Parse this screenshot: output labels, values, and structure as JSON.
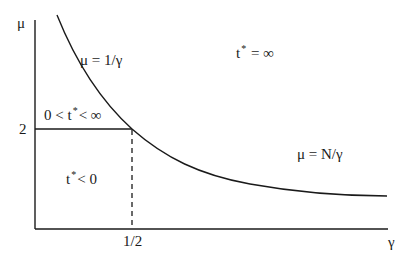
{
  "diagram": {
    "axes": {
      "y_label": "μ",
      "x_label": "γ",
      "y_tick_label": "2",
      "x_tick_label": "1/2"
    },
    "curve_labels": {
      "upper": "μ = 1/γ",
      "lower": "μ = N/γ"
    },
    "regions": {
      "infinite": {
        "t": "t",
        "sup": "*",
        "rel": " = ∞"
      },
      "bounded": {
        "pre": "0 < t",
        "sup": "*",
        "rel": "< ∞"
      },
      "negative": {
        "t": "t",
        "sup": "*",
        "rel": "< 0"
      }
    },
    "colors": {
      "line": "#1a1a1a",
      "background": "#ffffff"
    }
  }
}
